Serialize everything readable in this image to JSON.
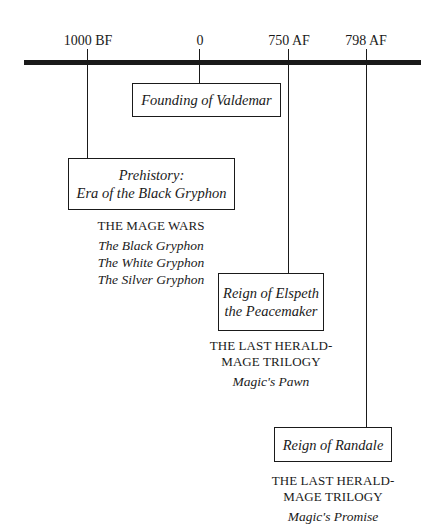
{
  "timeline": {
    "ticks": [
      {
        "label": "1000 BF",
        "x": 88
      },
      {
        "label": "0",
        "x": 200
      },
      {
        "label": "750 AF",
        "x": 289
      },
      {
        "label": "798 AF",
        "x": 366
      }
    ]
  },
  "events": {
    "founding": {
      "title": "Founding of Valdemar"
    },
    "prehistory": {
      "line1": "Prehistory:",
      "line2": "Era of the Black Gryphon"
    },
    "elspeth": {
      "line1": "Reign of Elspeth",
      "line2": "the Peacemaker"
    },
    "randale": {
      "title": "Reign of Randale"
    }
  },
  "captions": {
    "mage_wars": {
      "series": "THE MAGE WARS",
      "books": [
        "The Black Gryphon",
        "The White Gryphon",
        "The Silver Gryphon"
      ]
    },
    "elspeth": {
      "series_line1": "THE LAST HERALD-",
      "series_line2": "MAGE TRILOGY",
      "books": [
        "Magic's Pawn"
      ]
    },
    "randale": {
      "series_line1": "THE LAST HERALD-",
      "series_line2": "MAGE TRILOGY",
      "books": [
        "Magic's Promise"
      ]
    }
  }
}
